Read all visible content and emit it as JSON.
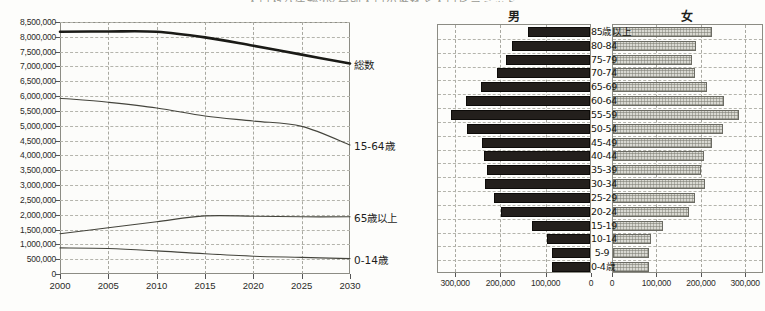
{
  "figure": {
    "title": "人口及び年齢3区分別人口の推移と人口ピラミッド"
  },
  "chart_data": [
    {
      "type": "line",
      "id": "population-projection",
      "title": "",
      "xlabel": "",
      "ylabel": "",
      "x": [
        2000,
        2005,
        2010,
        2015,
        2020,
        2025,
        2030
      ],
      "xlim": [
        2000,
        2030
      ],
      "ylim": [
        0,
        8500000
      ],
      "ytick_labels": [
        "0",
        "500,000",
        "1,000,000",
        "1,500,000",
        "2,000,000",
        "2,500,000",
        "3,000,000",
        "3,500,000",
        "4,000,000",
        "4,500,000",
        "5,000,000",
        "5,500,000",
        "6,000,000",
        "6,500,000",
        "7,000,000",
        "7,500,000",
        "8,000,000",
        "8,500,000"
      ],
      "yticks": [
        0,
        500000,
        1000000,
        1500000,
        2000000,
        2500000,
        3000000,
        3500000,
        4000000,
        4500000,
        5000000,
        5500000,
        6000000,
        6500000,
        7000000,
        7500000,
        8000000,
        8500000
      ],
      "xtick_labels": [
        "2000",
        "2005",
        "2010",
        "2015",
        "2020",
        "2025",
        "2030"
      ],
      "grid": true,
      "legend_position": "right-inline",
      "series": [
        {
          "name": "総数",
          "values": [
            8170000,
            8180000,
            8170000,
            7980000,
            7700000,
            7400000,
            7100000
          ],
          "style": "thick"
        },
        {
          "name": "15-64歳",
          "values": [
            5930000,
            5790000,
            5600000,
            5330000,
            5160000,
            4980000,
            4350000
          ],
          "style": "thin"
        },
        {
          "name": "65歳以上",
          "values": [
            1360000,
            1560000,
            1760000,
            1960000,
            1950000,
            1930000,
            1930000
          ],
          "style": "thin"
        },
        {
          "name": "0-14歳",
          "values": [
            880000,
            860000,
            780000,
            680000,
            600000,
            560000,
            520000
          ],
          "style": "thin"
        }
      ]
    },
    {
      "type": "bar",
      "id": "population-pyramid",
      "orientation": "horizontal-pyramid",
      "male_header": "男",
      "female_header": "女",
      "categories": [
        "85歳以上",
        "80-84",
        "75-79",
        "70-74",
        "65-69",
        "60-64",
        "55-59",
        "50-54",
        "45-49",
        "40-44",
        "35-39",
        "30-34",
        "25-29",
        "20-24",
        "15-19",
        "10-14",
        "5-9",
        "0-4歳"
      ],
      "male_axis_labels": [
        "300,000",
        "200,000",
        "100,000",
        "0"
      ],
      "male_axis_ticks": [
        300000,
        200000,
        100000,
        0
      ],
      "female_axis_labels": [
        "0",
        "100,000",
        "200,000",
        "300,000"
      ],
      "female_axis_ticks": [
        0,
        100000,
        200000,
        300000
      ],
      "xlim": [
        0,
        340000
      ],
      "grid": true,
      "series": [
        {
          "name": "男",
          "values": [
            136000,
            172000,
            186000,
            206000,
            240000,
            273000,
            307000,
            271000,
            239000,
            233000,
            228000,
            232000,
            211000,
            197000,
            127000,
            96000,
            85000,
            85000
          ]
        },
        {
          "name": "女",
          "values": [
            222000,
            187000,
            178000,
            184000,
            212000,
            249000,
            283000,
            248000,
            224000,
            206000,
            199000,
            207000,
            185000,
            171000,
            112000,
            85000,
            82000,
            80000
          ]
        }
      ]
    }
  ],
  "line_chart_labels": {
    "total": "総数",
    "working_age": "15-64歳",
    "elderly": "65歳以上",
    "children": "0-14歳"
  }
}
